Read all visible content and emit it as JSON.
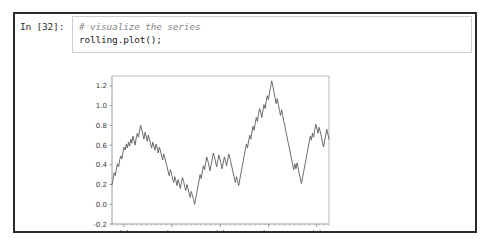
{
  "cell": {
    "prompt": "In [32]:",
    "code_lines": [
      "# visualize the series",
      "rolling.plot();"
    ]
  },
  "chart_data": {
    "type": "line",
    "title": "",
    "xlabel": "",
    "ylabel": "",
    "ylim": [
      -0.2,
      1.3
    ],
    "yticks": [
      "1.2",
      "1.0",
      "0.8",
      "0.6",
      "0.4",
      "0.2",
      "0.0",
      "-0.2"
    ],
    "ytick_values": [
      1.2,
      1.0,
      0.8,
      0.6,
      0.4,
      0.2,
      0.0,
      -0.2
    ],
    "xticks": [
      {
        "label": "Jul",
        "year": ""
      },
      {
        "label": "Jan",
        "year": "2014"
      },
      {
        "label": "Jul",
        "year": ""
      },
      {
        "label": "Jan",
        "year": "2015"
      },
      {
        "label": "Jul",
        "year": ""
      }
    ],
    "grid": false,
    "legend": false,
    "line_color": "#5b5b5b",
    "series": [
      {
        "name": "rolling",
        "values": [
          0.2,
          0.25,
          0.32,
          0.29,
          0.36,
          0.41,
          0.38,
          0.45,
          0.49,
          0.46,
          0.53,
          0.58,
          0.55,
          0.61,
          0.57,
          0.63,
          0.59,
          0.66,
          0.62,
          0.69,
          0.65,
          0.6,
          0.67,
          0.72,
          0.68,
          0.74,
          0.8,
          0.76,
          0.71,
          0.66,
          0.73,
          0.69,
          0.64,
          0.7,
          0.66,
          0.61,
          0.57,
          0.63,
          0.59,
          0.55,
          0.61,
          0.57,
          0.52,
          0.58,
          0.54,
          0.49,
          0.45,
          0.51,
          0.47,
          0.42,
          0.38,
          0.33,
          0.29,
          0.35,
          0.31,
          0.26,
          0.22,
          0.28,
          0.24,
          0.19,
          0.25,
          0.21,
          0.16,
          0.22,
          0.27,
          0.23,
          0.18,
          0.14,
          0.2,
          0.16,
          0.11,
          0.07,
          0.13,
          0.09,
          0.05,
          0.0,
          0.06,
          0.12,
          0.18,
          0.24,
          0.3,
          0.26,
          0.33,
          0.39,
          0.35,
          0.42,
          0.48,
          0.44,
          0.39,
          0.34,
          0.4,
          0.46,
          0.52,
          0.48,
          0.43,
          0.38,
          0.44,
          0.5,
          0.46,
          0.41,
          0.36,
          0.42,
          0.48,
          0.44,
          0.39,
          0.45,
          0.51,
          0.47,
          0.42,
          0.37,
          0.32,
          0.27,
          0.22,
          0.28,
          0.24,
          0.19,
          0.25,
          0.31,
          0.37,
          0.43,
          0.49,
          0.55,
          0.61,
          0.57,
          0.64,
          0.7,
          0.66,
          0.73,
          0.79,
          0.75,
          0.82,
          0.88,
          0.84,
          0.91,
          0.97,
          0.93,
          0.88,
          0.95,
          1.01,
          0.97,
          1.04,
          1.1,
          1.06,
          1.13,
          1.19,
          1.25,
          1.2,
          1.14,
          1.08,
          1.02,
          1.07,
          1.01,
          0.95,
          0.9,
          0.96,
          0.9,
          0.84,
          0.79,
          0.73,
          0.68,
          0.62,
          0.57,
          0.51,
          0.46,
          0.4,
          0.35,
          0.41,
          0.36,
          0.42,
          0.37,
          0.31,
          0.26,
          0.21,
          0.27,
          0.33,
          0.39,
          0.45,
          0.51,
          0.57,
          0.63,
          0.69,
          0.65,
          0.72,
          0.68,
          0.75,
          0.81,
          0.77,
          0.72,
          0.78,
          0.74,
          0.69,
          0.63,
          0.58,
          0.64,
          0.7,
          0.76,
          0.71,
          0.66
        ]
      }
    ]
  }
}
